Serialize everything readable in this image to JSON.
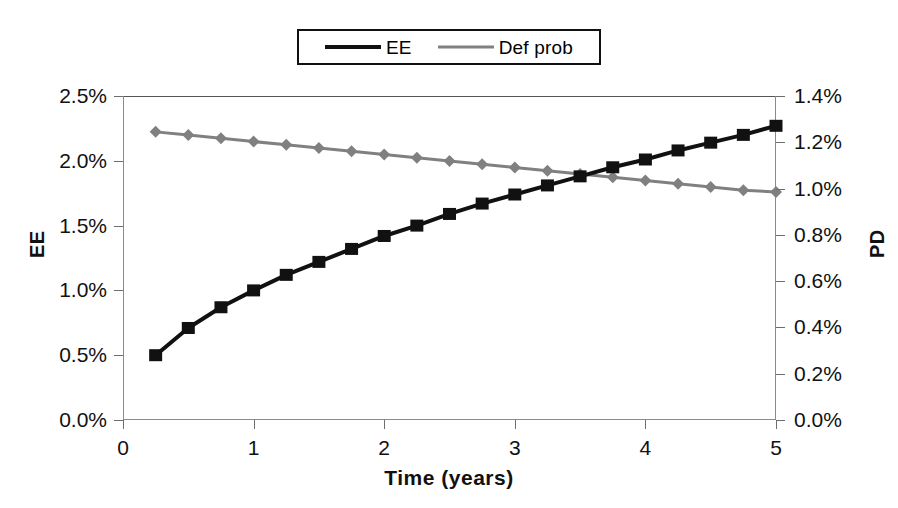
{
  "legend": {
    "position": "top-center",
    "entries": [
      {
        "label": "EE",
        "marker": "square-marker-icon",
        "color": "#111111"
      },
      {
        "label": "Def prob",
        "marker": "diamond-marker-icon",
        "color": "#808080"
      }
    ]
  },
  "axes": {
    "x": {
      "title": "Time (years)",
      "ticks": [
        "0",
        "1",
        "2",
        "3",
        "4",
        "5"
      ],
      "min": 0,
      "max": 5
    },
    "y_left": {
      "title": "EE",
      "ticks": [
        "0.0%",
        "0.5%",
        "1.0%",
        "1.5%",
        "2.0%",
        "2.5%"
      ],
      "min": 0,
      "max": 2.5
    },
    "y_right": {
      "title": "PD",
      "ticks": [
        "0.0%",
        "0.2%",
        "0.4%",
        "0.6%",
        "0.8%",
        "1.0%",
        "1.2%",
        "1.4%"
      ],
      "min": 0,
      "max": 1.4
    }
  },
  "chart_data": {
    "type": "line",
    "title": "",
    "xlabel": "Time (years)",
    "ylabel": "EE",
    "ylabel_secondary": "PD",
    "xlim": [
      0,
      5
    ],
    "ylim": [
      0,
      2.5
    ],
    "ylim_secondary": [
      0,
      1.4
    ],
    "grid": false,
    "legend_position": "top-center",
    "x": [
      0.25,
      0.5,
      0.75,
      1.0,
      1.25,
      1.5,
      1.75,
      2.0,
      2.25,
      2.5,
      2.75,
      3.0,
      3.25,
      3.5,
      3.75,
      4.0,
      4.25,
      4.5,
      4.75,
      5.0
    ],
    "series": [
      {
        "name": "EE",
        "axis": "left",
        "color": "#111111",
        "marker": "square",
        "unit": "%",
        "values": [
          0.5,
          0.71,
          0.87,
          1.0,
          1.12,
          1.22,
          1.32,
          1.42,
          1.5,
          1.59,
          1.67,
          1.74,
          1.81,
          1.88,
          1.95,
          2.01,
          2.08,
          2.14,
          2.2,
          2.27
        ]
      },
      {
        "name": "Def prob",
        "axis": "right",
        "color": "#808080",
        "marker": "diamond",
        "unit": "%",
        "values": [
          1.245,
          1.231,
          1.217,
          1.203,
          1.189,
          1.175,
          1.161,
          1.147,
          1.133,
          1.119,
          1.105,
          1.091,
          1.077,
          1.063,
          1.049,
          1.035,
          1.021,
          1.007,
          0.993,
          0.985
        ]
      }
    ]
  }
}
